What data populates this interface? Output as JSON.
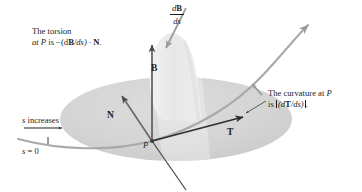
{
  "figure": {
    "background_color": "#ffffff",
    "ink_color": "#1c1c1c",
    "osculating_plane_fill": "#d6d6d6",
    "normal_plane_fill": "#ebebeb",
    "curve_color": "#a8a8a8",
    "vector_color": "#5a5a5a"
  },
  "annotations": {
    "torsion": {
      "line1": "The torsion",
      "line2_pre": "at ",
      "line2_p": "P",
      "line2_mid": " is −(d",
      "line2_b": "B",
      "line2_post": "/ds) · ",
      "line2_n": "N",
      "line2_end": "."
    },
    "curvature": {
      "line1_pre": "The curvature at ",
      "line1_p": "P",
      "line2_pre": "is ",
      "line2_abs_pre": "(d",
      "line2_t": "T",
      "line2_abs_post": "/ds)",
      "line2_end": "."
    },
    "arc_length": {
      "s_increases_s": "s",
      "s_increases_text": " increases",
      "s_zero_s": "s",
      "s_zero_eq": " = 0"
    }
  },
  "vectors": [
    {
      "name": "binormal",
      "label": "B",
      "direction": "up"
    },
    {
      "name": "principal-normal",
      "label": "N",
      "direction": "upper-left"
    },
    {
      "name": "unit-tangent",
      "label": "T",
      "direction": "right"
    }
  ],
  "points": [
    {
      "name": "point-p",
      "label": "P"
    }
  ],
  "derivative_vector": {
    "numerator_d": "d",
    "numerator_b": "B",
    "denominator": "ds"
  }
}
